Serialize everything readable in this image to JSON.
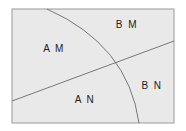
{
  "diagram": {
    "frame": {
      "x": 12,
      "y": 9,
      "width": 162,
      "height": 114,
      "fill": "#e9e9e9",
      "stroke": "#9a9a9a"
    },
    "divider_line": {
      "x1": 12,
      "y1": 101,
      "x2": 174,
      "y2": 41,
      "stroke": "#6a6a6a"
    },
    "arc": {
      "start_x": 47,
      "start_y": 9,
      "end_x": 139,
      "end_y": 123,
      "stroke": "#6a6a6a"
    },
    "regions": [
      {
        "id": "AM",
        "label": "A M",
        "x": 54,
        "y": 52
      },
      {
        "id": "BM",
        "label": "B M",
        "x": 127,
        "y": 28
      },
      {
        "id": "AN",
        "label": "A N",
        "x": 85,
        "y": 103
      },
      {
        "id": "BN",
        "label": "B N",
        "x": 152,
        "y": 89
      }
    ]
  }
}
